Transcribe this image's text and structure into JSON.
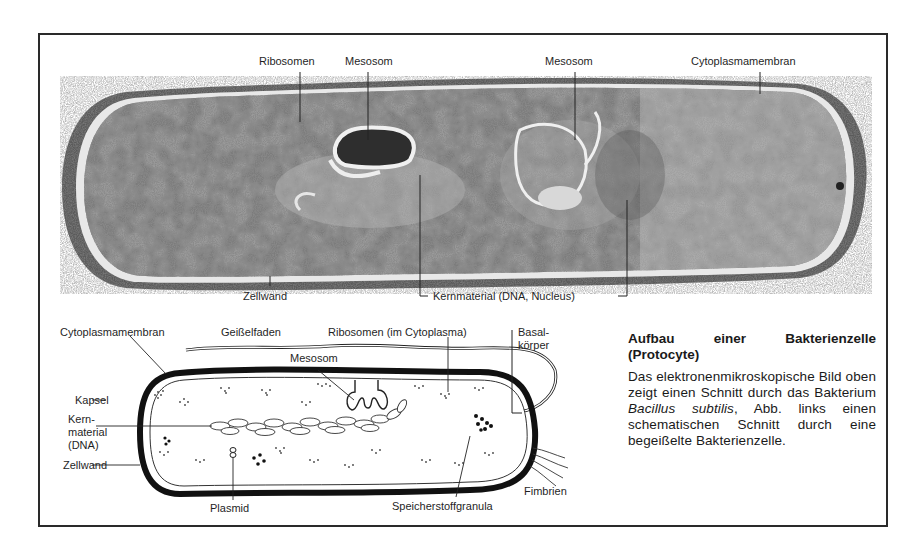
{
  "figure": {
    "micrograph_labels": {
      "ribosomen": "Ribosomen",
      "mesosom_left": "Mesosom",
      "mesosom_right": "Mesosom",
      "cytoplasmamembran": "Cytoplasmamembran",
      "zellwand": "Zellwand",
      "kernmaterial": "Kernmaterial (DNA, Nucleus)"
    },
    "schematic_labels": {
      "cytoplasmamembran": "Cytoplasmamembran",
      "geisselfaden": "Geißelfaden",
      "ribosomen": "Ribosomen (im Cytoplasma)",
      "basalkoerper_1": "Basal-",
      "basalkoerper_2": "körper",
      "mesosom": "Mesosom",
      "kapsel": "Kapsel",
      "kernmaterial_1": "Kern-",
      "kernmaterial_2": "material",
      "kernmaterial_3": "(DNA)",
      "zellwand": "Zellwand",
      "plasmid": "Plasmid",
      "speicherstoffgranula": "Speicherstoffgranula",
      "fimbrien": "Fimbrien"
    },
    "caption": {
      "title": "Aufbau einer Bakterienzelle (Protocyte)",
      "body_part1": "Das elektronenmikroskopische Bild oben zeigt einen Schnitt durch das Bakterium ",
      "species": "Bacillus subtilis",
      "body_part2": ", Abb. links einen schematischen Schnitt durch eine begeißelte Bakterienzelle."
    }
  }
}
